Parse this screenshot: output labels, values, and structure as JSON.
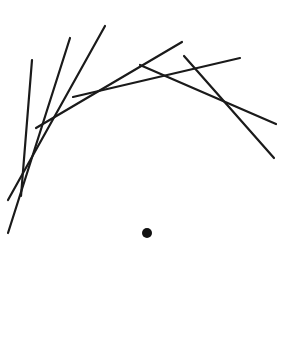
{
  "figure": {
    "width": 296,
    "height": 346,
    "background": "#ffffff",
    "ink_color": "#1a1a1a",
    "lines": [
      {
        "id": "line-1",
        "x1": 32,
        "y1": 60,
        "x2": 21,
        "y2": 196
      },
      {
        "id": "line-2",
        "x1": 70,
        "y1": 38,
        "x2": 8,
        "y2": 233
      },
      {
        "id": "line-3",
        "x1": 105,
        "y1": 26,
        "x2": 8,
        "y2": 200
      },
      {
        "id": "line-4",
        "x1": 36,
        "y1": 128,
        "x2": 182,
        "y2": 42
      },
      {
        "id": "line-5",
        "x1": 73,
        "y1": 97,
        "x2": 240,
        "y2": 58
      },
      {
        "id": "line-6",
        "x1": 140,
        "y1": 65,
        "x2": 276,
        "y2": 124
      },
      {
        "id": "line-7",
        "x1": 184,
        "y1": 56,
        "x2": 274,
        "y2": 158
      }
    ],
    "dot": {
      "cx": 147,
      "cy": 233,
      "r": 5
    }
  }
}
